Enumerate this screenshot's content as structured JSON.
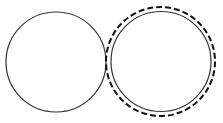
{
  "diagram": {
    "width": 223,
    "height": 123,
    "background": "#ffffff",
    "shapes": [
      {
        "id": "left-circle",
        "type": "circle",
        "cx": 56,
        "cy": 62,
        "r": 50,
        "stroke": "#333333",
        "stroke_width": 1.2,
        "dashed": false
      },
      {
        "id": "right-circle",
        "type": "circle",
        "cx": 161,
        "cy": 61.5,
        "r": 50,
        "stroke": "#333333",
        "stroke_width": 1.2,
        "dashed": false
      },
      {
        "id": "right-dashed-circle",
        "type": "circle",
        "cx": 160.5,
        "cy": 61.5,
        "r": 54.5,
        "stroke": "#111111",
        "stroke_width": 2,
        "dashed": true,
        "dash_pattern": "6 3"
      }
    ]
  }
}
